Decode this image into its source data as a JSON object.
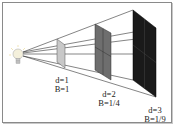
{
  "diagram": {
    "source": {
      "icon": "light-bulb-icon"
    },
    "colors": {
      "panel1": "#c8c8c8",
      "panel2": "#6e6e6e",
      "panel3": "#1a1a1a",
      "lines": "#333333",
      "frame": "#8a8a8a"
    },
    "panels": [
      {
        "distance_label": "d=1",
        "brightness_label": "B=1",
        "d": 1,
        "B": "1"
      },
      {
        "distance_label": "d=2",
        "brightness_label": "B=1/4",
        "d": 2,
        "B": "1/4"
      },
      {
        "distance_label": "d=3",
        "brightness_label": "B=1/9",
        "d": 3,
        "B": "1/9"
      }
    ]
  }
}
